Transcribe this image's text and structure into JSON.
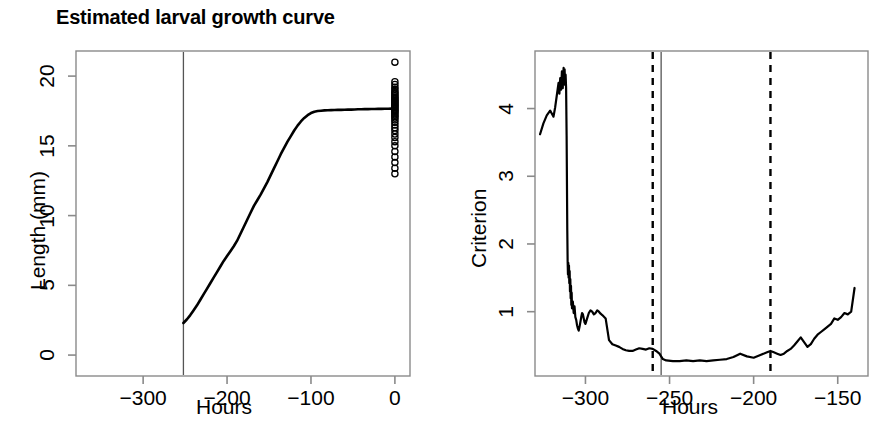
{
  "figure": {
    "width": 872,
    "height": 425,
    "background": "#ffffff",
    "line_color": "#000000",
    "panel_count": 2
  },
  "chart_data": [
    {
      "id": "larval-growth-curve",
      "type": "line",
      "title": "Estimated larval growth curve",
      "xlabel": "Hours",
      "ylabel": "Length (mm)",
      "xlim": [
        -380,
        18
      ],
      "ylim": [
        -1.5,
        21.8
      ],
      "xticks": [
        -300,
        -200,
        -100,
        0
      ],
      "xticklabels": [
        "−300",
        "−200",
        "−100",
        "0"
      ],
      "yticks": [
        0,
        5,
        10,
        15,
        20
      ],
      "yticklabels": [
        "0",
        "5",
        "10",
        "15",
        "20"
      ],
      "grid": false,
      "legend": null,
      "annotations": [
        {
          "kind": "vline",
          "style": "solid",
          "x": -252,
          "label": "hatch-reference-line"
        }
      ],
      "series": [
        {
          "name": "fitted growth curve",
          "style": "solid",
          "x": [
            -252,
            -248,
            -244,
            -240,
            -236,
            -232,
            -228,
            -224,
            -220,
            -216,
            -212,
            -208,
            -204,
            -200,
            -196,
            -192,
            -188,
            -184,
            -180,
            -176,
            -172,
            -168,
            -164,
            -160,
            -156,
            -152,
            -148,
            -144,
            -140,
            -136,
            -132,
            -128,
            -124,
            -120,
            -116,
            -112,
            -108,
            -104,
            -100,
            -96,
            -92,
            -88,
            -84,
            -80,
            -76,
            -72,
            -68,
            -64,
            -60,
            -56,
            -52,
            -48,
            -44,
            -40,
            -36,
            -32,
            -28,
            -24,
            -20,
            -16,
            -12,
            -8,
            -4,
            0
          ],
          "y": [
            2.3,
            2.55,
            2.85,
            3.2,
            3.55,
            3.95,
            4.35,
            4.75,
            5.15,
            5.55,
            5.95,
            6.35,
            6.75,
            7.1,
            7.45,
            7.8,
            8.2,
            8.7,
            9.2,
            9.7,
            10.2,
            10.7,
            11.1,
            11.5,
            11.95,
            12.4,
            12.9,
            13.4,
            13.9,
            14.4,
            14.85,
            15.3,
            15.7,
            16.1,
            16.45,
            16.75,
            17.0,
            17.2,
            17.35,
            17.45,
            17.5,
            17.52,
            17.54,
            17.55,
            17.56,
            17.57,
            17.58,
            17.58,
            17.59,
            17.6,
            17.6,
            17.61,
            17.62,
            17.62,
            17.63,
            17.63,
            17.64,
            17.64,
            17.65,
            17.65,
            17.66,
            17.66,
            17.67,
            17.67
          ]
        }
      ],
      "points": {
        "name": "observed final lengths",
        "marker": "open-circle",
        "x_value": 0,
        "y_values": [
          21.0,
          19.6,
          19.4,
          19.2,
          19.05,
          18.9,
          18.8,
          18.7,
          18.6,
          18.5,
          18.42,
          18.34,
          18.26,
          18.18,
          18.1,
          18.02,
          17.95,
          17.88,
          17.8,
          17.72,
          17.64,
          17.56,
          17.48,
          17.4,
          17.3,
          17.2,
          17.1,
          17.0,
          16.85,
          16.7,
          16.5,
          16.3,
          16.1,
          15.85,
          15.6,
          15.3,
          15.0,
          14.6,
          14.2,
          13.8,
          13.4,
          13.0
        ]
      }
    },
    {
      "id": "criterion-profile",
      "type": "line",
      "title": "",
      "xlabel": "Hours",
      "ylabel": "Criterion",
      "xlim": [
        -330,
        -132
      ],
      "ylim": [
        0.05,
        4.85
      ],
      "xticks": [
        -300,
        -250,
        -200,
        -150
      ],
      "xticklabels": [
        "−300",
        "−250",
        "−200",
        "−150"
      ],
      "yticks": [
        1,
        2,
        3,
        4
      ],
      "yticklabels": [
        "1",
        "2",
        "3",
        "4"
      ],
      "grid": false,
      "legend": null,
      "annotations": [
        {
          "kind": "vline",
          "style": "dashed",
          "x": -260,
          "label": "ci-lower-bound"
        },
        {
          "kind": "vline",
          "style": "solid",
          "x": -255,
          "label": "criterion-minimum"
        },
        {
          "kind": "vline",
          "style": "dashed",
          "x": -190,
          "label": "ci-upper-bound"
        }
      ],
      "series": [
        {
          "name": "criterion",
          "style": "solid",
          "x": [
            -327,
            -325,
            -323,
            -321,
            -319,
            -318,
            -317,
            -316,
            -315.5,
            -315,
            -314.5,
            -314,
            -313.5,
            -313,
            -312.7,
            -312.4,
            -312.1,
            -311.8,
            -311.5,
            -311.2,
            -311.0,
            -310.8,
            -310.6,
            -310.4,
            -310.2,
            -310.0,
            -309.8,
            -309.6,
            -309.4,
            -309.2,
            -309.0,
            -308.8,
            -308.6,
            -308.4,
            -308.2,
            -308.0,
            -307.5,
            -307.0,
            -306.5,
            -306.0,
            -305.5,
            -305.0,
            -304.5,
            -304.0,
            -303.5,
            -303.0,
            -302.5,
            -302.0,
            -301.5,
            -301.0,
            -300.5,
            -300.0,
            -299,
            -298,
            -297,
            -296,
            -295,
            -294,
            -293,
            -292,
            -291,
            -290,
            -288,
            -286,
            -284,
            -282,
            -280,
            -278,
            -276,
            -274,
            -272,
            -270,
            -268,
            -266,
            -264,
            -262,
            -260,
            -258,
            -256,
            -254,
            -252,
            -248,
            -244,
            -240,
            -236,
            -232,
            -228,
            -224,
            -220,
            -216,
            -212,
            -208,
            -204,
            -200,
            -196,
            -192,
            -190,
            -188,
            -186,
            -184,
            -182,
            -180,
            -178,
            -176,
            -174,
            -172,
            -170,
            -168,
            -166,
            -164,
            -162,
            -160,
            -158,
            -156,
            -154,
            -152,
            -150,
            -148,
            -146,
            -144,
            -142,
            -140
          ],
          "y": [
            3.62,
            3.78,
            3.9,
            3.97,
            3.88,
            4.02,
            4.2,
            4.38,
            4.22,
            4.45,
            4.28,
            4.55,
            4.3,
            4.6,
            4.45,
            4.58,
            4.35,
            4.5,
            4.3,
            3.6,
            2.9,
            2.2,
            1.75,
            1.55,
            1.72,
            1.5,
            1.68,
            1.42,
            1.6,
            1.3,
            1.48,
            1.2,
            1.38,
            1.1,
            1.28,
            1.05,
            1.15,
            0.98,
            1.08,
            0.92,
            0.88,
            0.8,
            0.75,
            0.72,
            0.78,
            0.85,
            0.92,
            0.98,
            0.96,
            0.9,
            0.84,
            0.82,
            0.9,
            0.98,
            1.02,
            1.0,
            0.96,
            0.98,
            1.02,
            1.0,
            0.97,
            0.95,
            0.9,
            0.58,
            0.52,
            0.5,
            0.48,
            0.45,
            0.43,
            0.42,
            0.42,
            0.44,
            0.46,
            0.45,
            0.44,
            0.46,
            0.45,
            0.42,
            0.38,
            0.3,
            0.28,
            0.27,
            0.27,
            0.28,
            0.27,
            0.28,
            0.27,
            0.28,
            0.29,
            0.3,
            0.33,
            0.38,
            0.34,
            0.32,
            0.36,
            0.4,
            0.42,
            0.4,
            0.38,
            0.36,
            0.38,
            0.42,
            0.45,
            0.5,
            0.56,
            0.62,
            0.55,
            0.48,
            0.52,
            0.6,
            0.66,
            0.7,
            0.74,
            0.78,
            0.82,
            0.9,
            0.88,
            0.92,
            0.98,
            0.96,
            1.0,
            1.35,
            1.7,
            2.02
          ]
        }
      ]
    }
  ]
}
